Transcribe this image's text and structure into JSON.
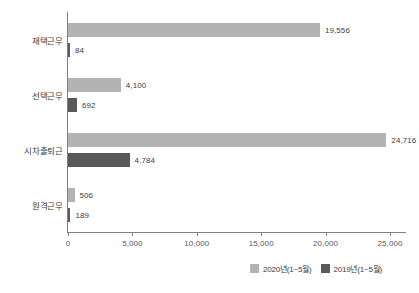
{
  "chart_data": {
    "type": "bar",
    "orientation": "horizontal",
    "title": "",
    "subtitle": "",
    "xlabel": "",
    "ylabel": "",
    "xlim": [
      0,
      26500
    ],
    "grid": false,
    "legend_position": "bottom-right",
    "categories": [
      "재택근무",
      "선택근무",
      "시차출퇴근",
      "원격근무"
    ],
    "tick_labels": [
      "0",
      "5,000",
      "10,000",
      "15,000",
      "20,000",
      "25,000"
    ],
    "tick_values": [
      0,
      5000,
      10000,
      15000,
      20000,
      25000
    ],
    "series": [
      {
        "name": "2020년(1~5월)",
        "color": "#b3b3b3",
        "values": [
          19556,
          4100,
          24716,
          506
        ],
        "value_labels": [
          "19,556",
          "4,100",
          "24,716",
          "506"
        ]
      },
      {
        "name": "2019년(1~5월)",
        "color": "#59595b",
        "values": [
          84,
          692,
          4784,
          189
        ],
        "value_labels": [
          "84",
          "692",
          "4,784",
          "189"
        ]
      }
    ]
  },
  "legend": {
    "items": [
      {
        "label": "2020년(1~5월)",
        "color": "#b3b3b3"
      },
      {
        "label": "2019년(1~5월)",
        "color": "#59595b"
      }
    ]
  },
  "axis": {
    "line_color": "#808080",
    "text_color": "#3c3c3c"
  }
}
